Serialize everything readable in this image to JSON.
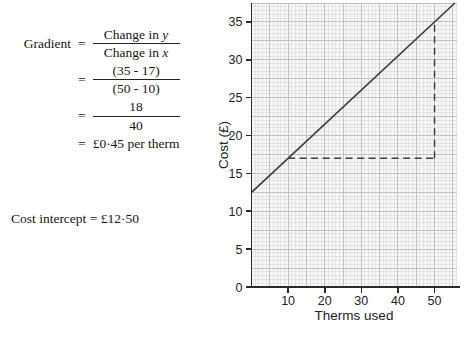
{
  "worked_example": {
    "lhs": "Gradient",
    "equals": "=",
    "step1": {
      "num_pre": "Change in ",
      "num_var": "y",
      "den_pre": "Change in ",
      "den_var": "x"
    },
    "step2": {
      "num": "(35 - 17)",
      "den": "(50 - 10)"
    },
    "step3": {
      "num": "18",
      "den": "40"
    },
    "step4": "£0·45 per therm",
    "cost_intercept": "Cost intercept = £12·50"
  },
  "chart_data": {
    "type": "line",
    "title": "",
    "xlabel": "Therms used",
    "ylabel": "Cost (£)",
    "xlim": [
      0,
      56
    ],
    "ylim": [
      0,
      37.5
    ],
    "x_ticks": [
      10,
      20,
      30,
      40,
      50
    ],
    "y_ticks": [
      0,
      5,
      10,
      15,
      20,
      25,
      30,
      35
    ],
    "grid": {
      "on": true,
      "minor_x": 1,
      "minor_y": 0.5,
      "major_x": 5,
      "major_y": 2.5
    },
    "series": [
      {
        "name": "cost line",
        "gradient": 0.45,
        "intercept": 12.5,
        "points": [
          [
            0,
            12.5
          ],
          [
            10,
            17
          ],
          [
            50,
            35
          ]
        ]
      }
    ],
    "annotations": [
      {
        "name": "run-change-in-x",
        "style": "dashed",
        "from": [
          10,
          17
        ],
        "to": [
          50,
          17
        ]
      },
      {
        "name": "rise-change-in-y",
        "style": "dashed",
        "from": [
          50,
          17
        ],
        "to": [
          50,
          35
        ]
      }
    ],
    "legend": "none",
    "colors": {
      "line": "#3d3d3d",
      "dashed": "#3d3d3d",
      "axis": "#2a2a2a",
      "grid_minor": "#dedddb",
      "grid_major": "#c2c1bf",
      "plot_bg": "#f8f8f6",
      "text": "#222222"
    }
  }
}
